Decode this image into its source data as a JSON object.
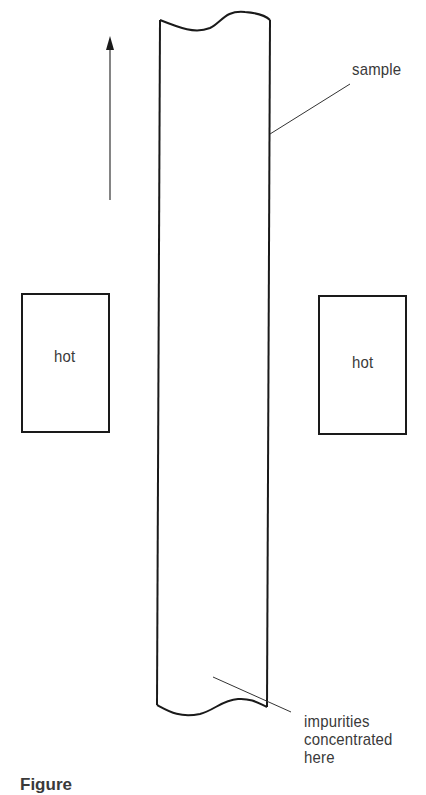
{
  "diagram": {
    "type": "zone-refining-schematic",
    "labels": {
      "sample": "sample",
      "hot_left": "hot",
      "hot_right": "hot",
      "impurities_line1": "impurities",
      "impurities_line2": "concentrated",
      "impurities_line3": "here"
    },
    "caption": "Figure",
    "elements": {
      "arrow": {
        "direction": "up",
        "meaning": "motion-direction"
      },
      "sample_rod": {
        "shape": "vertical cylinder with wavy broken ends"
      },
      "heaters": [
        "left heater box",
        "right heater box"
      ]
    },
    "colors": {
      "stroke": "#1a1a1a",
      "text": "#3a3a3a",
      "background": "#ffffff"
    }
  }
}
